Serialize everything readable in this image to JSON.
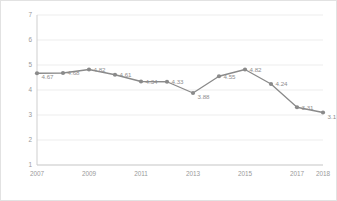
{
  "chart_data": {
    "type": "line",
    "title": "",
    "xlabel": "",
    "ylabel": "",
    "ylim": [
      1,
      7
    ],
    "yticks": [
      1,
      2,
      3,
      4,
      5,
      6,
      7
    ],
    "grid": true,
    "legend": false,
    "legend_position": "none",
    "categories": [
      "2007",
      "2008",
      "2009",
      "2010",
      "2011",
      "2012",
      "2013",
      "2014",
      "2015",
      "2016",
      "2017",
      "2018"
    ],
    "xtick_labels": [
      "2007",
      "2009",
      "2011",
      "2013",
      "2015",
      "2017",
      "2018"
    ],
    "values": [
      4.67,
      4.68,
      4.82,
      4.61,
      4.34,
      4.33,
      3.88,
      4.55,
      4.82,
      4.24,
      3.31,
      3.1
    ],
    "point_labels": [
      "4.67",
      "4.68",
      "4.82",
      "4.61",
      "4.34",
      "4.33",
      "3.88",
      "4.55",
      "4.82",
      "4.24",
      "3.31",
      "3.1"
    ],
    "series": [
      {
        "name": "",
        "values": [
          4.67,
          4.68,
          4.82,
          4.61,
          4.34,
          4.33,
          3.88,
          4.55,
          4.82,
          4.24,
          3.31,
          3.1
        ]
      }
    ],
    "colors": {
      "line": "#8a8a8a",
      "marker": "#8a8a8a",
      "grid": "#e8e8e8",
      "axis": "#c9c9c9",
      "tick_text": "#9a9a9a",
      "label_text": "#8e8e8e",
      "background": "#ffffff",
      "border": "#e2e2e2"
    }
  }
}
